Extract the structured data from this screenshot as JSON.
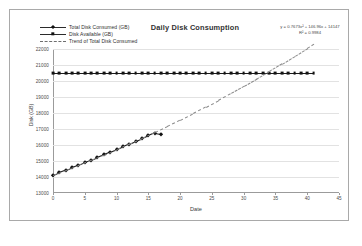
{
  "chart_data": {
    "type": "line",
    "title": "Daily Disk Consumption",
    "xlabel": "Date",
    "ylabel": "Disk (GB)",
    "xlim": [
      0,
      45
    ],
    "ylim": [
      13000,
      22000
    ],
    "xticks": [
      0,
      5,
      10,
      15,
      20,
      25,
      30,
      35,
      40,
      45
    ],
    "yticks": [
      13000,
      14000,
      15000,
      16000,
      17000,
      18000,
      19000,
      20000,
      21000,
      22000
    ],
    "grid": true,
    "legend_position": "top-left",
    "annotations": {
      "equation": "y = 0.7673x² + 146.96x + 14147",
      "r_squared": "R² = 0.9984"
    },
    "series": [
      {
        "name": "Total Disk Consumed (GB)",
        "marker": "diamond",
        "style": "solid",
        "x": [
          0,
          1,
          2,
          3,
          4,
          5,
          6,
          7,
          8,
          9,
          10,
          11,
          12,
          13,
          14,
          15,
          16,
          17
        ],
        "values": [
          14140,
          14300,
          14450,
          14610,
          14760,
          14920,
          15080,
          15240,
          15410,
          15580,
          15750,
          15920,
          16090,
          16260,
          16430,
          16600,
          16770,
          16700
        ]
      },
      {
        "name": "Disk Available (GB)",
        "marker": "square",
        "style": "solid",
        "x": [
          0,
          1,
          2,
          3,
          4,
          5,
          6,
          7,
          8,
          9,
          10,
          11,
          12,
          13,
          14,
          15,
          16,
          17,
          18,
          19,
          20,
          21,
          22,
          23,
          24,
          25,
          26,
          27,
          28,
          29,
          30,
          31,
          32,
          33,
          34,
          35,
          36,
          37,
          38,
          39,
          40,
          41
        ],
        "values": [
          20480,
          20480,
          20480,
          20480,
          20480,
          20480,
          20480,
          20480,
          20480,
          20480,
          20480,
          20480,
          20480,
          20480,
          20480,
          20480,
          20480,
          20480,
          20480,
          20480,
          20480,
          20480,
          20480,
          20480,
          20480,
          20480,
          20480,
          20480,
          20480,
          20480,
          20480,
          20480,
          20480,
          20480,
          20480,
          20480,
          20480,
          20480,
          20480,
          20480,
          20480,
          20480
        ]
      },
      {
        "name": "Trend of Total Disk Consumed",
        "marker": "none",
        "style": "dashed",
        "x": [
          0,
          2,
          4,
          6,
          8,
          10,
          12,
          14,
          16,
          18,
          20,
          22,
          24,
          26,
          28,
          30,
          32,
          34,
          36,
          38,
          40,
          41
        ],
        "values": [
          14147,
          14444,
          14752,
          15069,
          15398,
          15736,
          16085,
          16444,
          16814,
          17194,
          17585,
          17986,
          18397,
          18819,
          19252,
          19694,
          20148,
          20611,
          21085,
          21570,
          22065,
          22316
        ]
      }
    ]
  },
  "legend": {
    "items": [
      {
        "label": "Total Disk Consumed (GB)",
        "marker": "diamond",
        "style": "solid"
      },
      {
        "label": "Disk Available (GB)",
        "marker": "square",
        "style": "solid"
      },
      {
        "label": "Trend of Total Disk Consumed",
        "marker": "none",
        "style": "dashed"
      }
    ]
  }
}
